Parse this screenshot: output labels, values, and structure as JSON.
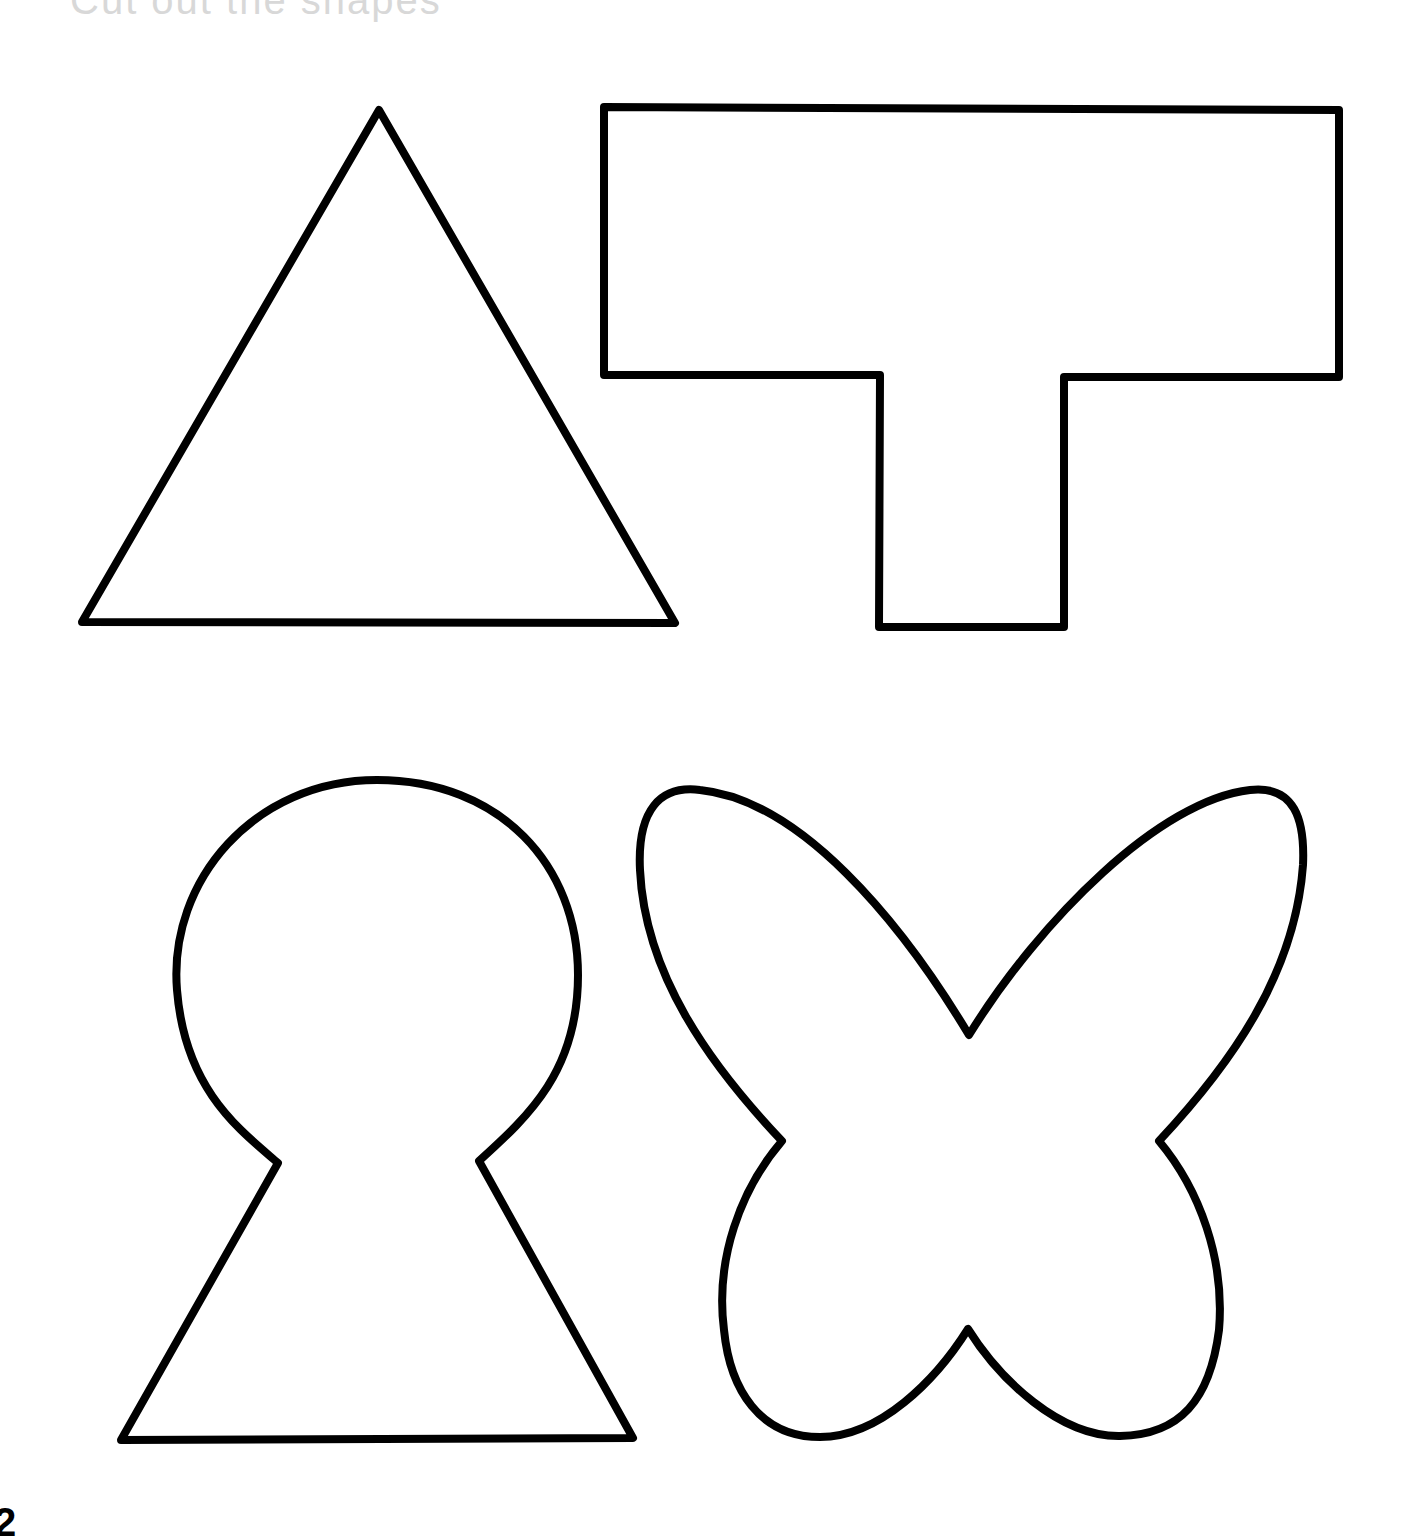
{
  "page": {
    "header_text": "Cut out the shapes",
    "page_number": "2",
    "background_color": "#ffffff",
    "stroke_color": "#000000"
  },
  "shapes": [
    {
      "name": "triangle",
      "label": "Triangle"
    },
    {
      "name": "t-shape",
      "label": "T shape"
    },
    {
      "name": "keyhole",
      "label": "Keyhole"
    },
    {
      "name": "butterfly",
      "label": "Butterfly"
    }
  ]
}
